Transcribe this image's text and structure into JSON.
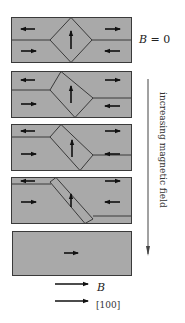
{
  "labels": {
    "field_zero": "B = 0",
    "field_zero_var": "B",
    "field_zero_eq": " = 0",
    "axis_label": "increasing magnetic field",
    "legend_field": "B",
    "legend_direction": "[100]"
  },
  "panels": [
    {
      "stage": 1,
      "description": "Four closure domains with central diamond, B = 0",
      "walls": "symmetric diamond"
    },
    {
      "stage": 2,
      "description": "Diamond shifted, right domain wall moves down"
    },
    {
      "stage": 3,
      "description": "Diamond elongated, right wall further down"
    },
    {
      "stage": 4,
      "description": "Diamond becomes slanted band"
    },
    {
      "stage": 5,
      "description": "Single domain magnetized along B"
    }
  ],
  "colors": {
    "domain_fill": "#a9a9a9",
    "wall": "#3a3a3a",
    "arrow": "#111111"
  }
}
